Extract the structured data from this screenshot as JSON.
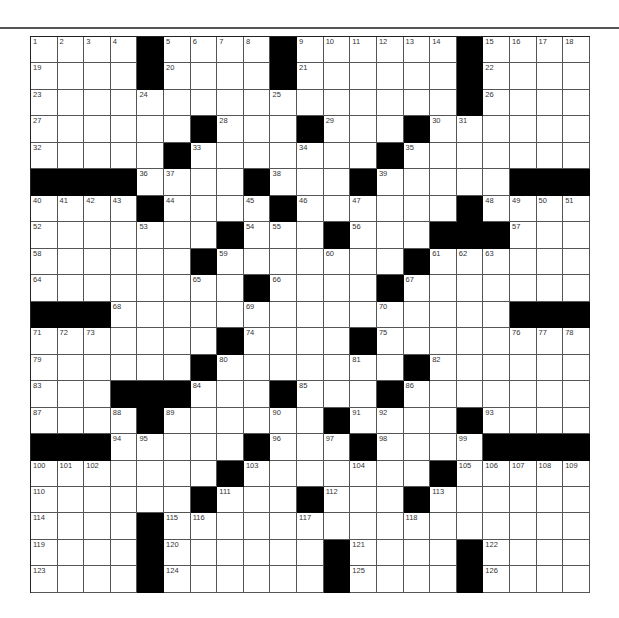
{
  "puzzle": {
    "rows": 21,
    "cols": 21,
    "black_cells": {
      "1": [
        5,
        10,
        17
      ],
      "2": [
        5,
        10,
        17
      ],
      "3": [
        17
      ],
      "4": [
        7,
        11,
        15
      ],
      "5": [
        6,
        14
      ],
      "6": [
        1,
        2,
        3,
        4,
        9,
        13,
        19,
        20,
        21
      ],
      "7": [
        5,
        10,
        17
      ],
      "8": [
        8,
        12,
        16,
        17,
        18
      ],
      "9": [
        7,
        15
      ],
      "10": [
        9,
        14
      ],
      "11": [
        1,
        2,
        3,
        19,
        20,
        21
      ],
      "12": [
        8,
        13
      ],
      "13": [
        7,
        15
      ],
      "14": [
        4,
        5,
        6,
        10,
        14
      ],
      "15": [
        5,
        12,
        17
      ],
      "16": [
        1,
        2,
        3,
        9,
        13,
        18,
        19,
        20,
        21
      ],
      "17": [
        8,
        16
      ],
      "18": [
        7,
        11,
        15
      ],
      "19": [
        5
      ],
      "20": [
        5,
        12,
        17
      ],
      "21": [
        5,
        12,
        17
      ]
    },
    "numbers": {
      "1": {
        "1": 1,
        "2": 2,
        "3": 3,
        "4": 4,
        "6": 5,
        "7": 6,
        "8": 7,
        "9": 8,
        "11": 9,
        "12": 10,
        "13": 11,
        "14": 12,
        "15": 13,
        "16": 14,
        "18": 15,
        "19": 16,
        "20": 17,
        "21": 18
      },
      "2": {
        "1": 19,
        "6": 20,
        "11": 21,
        "18": 22
      },
      "3": {
        "1": 23,
        "5": 24,
        "10": 25,
        "18": 26
      },
      "4": {
        "1": 27,
        "8": 28,
        "12": 29,
        "16": 30,
        "17": 31
      },
      "5": {
        "1": 32,
        "7": 33,
        "11": 34,
        "15": 35
      },
      "6": {
        "5": 36,
        "6": 37,
        "10": 38,
        "14": 39
      },
      "7": {
        "1": 40,
        "2": 41,
        "3": 42,
        "4": 43,
        "6": 44,
        "9": 45,
        "11": 46,
        "13": 47,
        "18": 48,
        "19": 49,
        "20": 50,
        "21": 51
      },
      "8": {
        "1": 52,
        "5": 53,
        "9": 54,
        "10": 55,
        "13": 56,
        "19": 57
      },
      "9": {
        "1": 58,
        "8": 59,
        "12": 60,
        "16": 61,
        "17": 62,
        "18": 63
      },
      "10": {
        "1": 64,
        "7": 65,
        "10": 66,
        "15": 67
      },
      "11": {
        "4": 68,
        "9": 69,
        "14": 70
      },
      "12": {
        "1": 71,
        "2": 72,
        "3": 73,
        "9": 74,
        "14": 75,
        "19": 76,
        "20": 77,
        "21": 78
      },
      "13": {
        "1": 79,
        "8": 80,
        "13": 81,
        "16": 82
      },
      "14": {
        "1": 83,
        "7": 84,
        "11": 85,
        "15": 86
      },
      "15": {
        "1": 87,
        "4": 88,
        "6": 89,
        "10": 90,
        "13": 91,
        "14": 92,
        "18": 93
      },
      "16": {
        "4": 94,
        "5": 95,
        "10": 96,
        "12": 97,
        "14": 98,
        "17": 99
      },
      "17": {
        "1": 100,
        "2": 101,
        "3": 102,
        "9": 103,
        "13": 104,
        "17": 105,
        "18": 106,
        "19": 107,
        "20": 108,
        "21": 109
      },
      "18": {
        "1": 110,
        "8": 111,
        "12": 112,
        "16": 113
      },
      "19": {
        "1": 114,
        "6": 115,
        "7": 116,
        "11": 117,
        "15": 118
      },
      "20": {
        "1": 119,
        "6": 120,
        "13": 121,
        "18": 122
      },
      "21": {
        "1": 123,
        "6": 124,
        "13": 125,
        "18": 126
      }
    },
    "colors": {
      "black_cell": "#000000",
      "white_cell": "#ffffff",
      "grid_line": "#555555",
      "rule": "#555555"
    }
  }
}
